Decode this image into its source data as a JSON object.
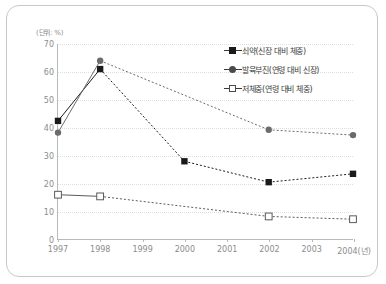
{
  "unit_label": "(단위: %)",
  "legend": {
    "position": "top-right",
    "items": [
      {
        "label": "쇠약(신장 대비 체중)",
        "marker": "filled-square",
        "key": "wasting"
      },
      {
        "label": "발육부진(연령 대비 신장)",
        "marker": "filled-circle",
        "key": "stunting"
      },
      {
        "label": "저체중(연령 대비 체중)",
        "marker": "open-square",
        "key": "underweight"
      }
    ]
  },
  "chart_data": {
    "type": "line",
    "title": "",
    "xlabel": "",
    "ylabel": "",
    "unit": "(단위: %)",
    "grid": true,
    "legend_position": "top-right",
    "categories": [
      "1997",
      "1998",
      "1999",
      "2000",
      "2001",
      "2002",
      "2003",
      "2004(년)"
    ],
    "x": [
      1997,
      1998,
      1999,
      2000,
      2001,
      2002,
      2003,
      2004
    ],
    "ylim": [
      0,
      70
    ],
    "yticks": [
      0,
      10,
      20,
      30,
      40,
      50,
      60,
      70
    ],
    "xticks": [
      "1997",
      "1998",
      "1999",
      "2000",
      "2001",
      "2002",
      "2003",
      "2004(년)"
    ],
    "series": [
      {
        "name": "쇠약(신장 대비 체중)",
        "marker": "filled-square",
        "color": "#1a1a1a",
        "points": [
          {
            "x": 1997,
            "y": 42.4
          },
          {
            "x": 1998,
            "y": 61.0
          },
          {
            "x": 2000,
            "y": 27.9
          },
          {
            "x": 2002,
            "y": 20.4
          },
          {
            "x": 2004,
            "y": 23.4
          }
        ]
      },
      {
        "name": "발육부진(연령 대비 신장)",
        "marker": "filled-circle",
        "color": "#6b6b6b",
        "points": [
          {
            "x": 1997,
            "y": 38.2
          },
          {
            "x": 1998,
            "y": 64.0
          },
          {
            "x": 2002,
            "y": 39.2
          },
          {
            "x": 2004,
            "y": 37.3
          }
        ]
      },
      {
        "name": "저체중(연령 대비 체중)",
        "marker": "open-square",
        "color": "#5a5a5a",
        "points": [
          {
            "x": 1997,
            "y": 15.9
          },
          {
            "x": 1998,
            "y": 15.3
          },
          {
            "x": 2002,
            "y": 8.1
          },
          {
            "x": 2004,
            "y": 7.1
          }
        ]
      }
    ]
  }
}
